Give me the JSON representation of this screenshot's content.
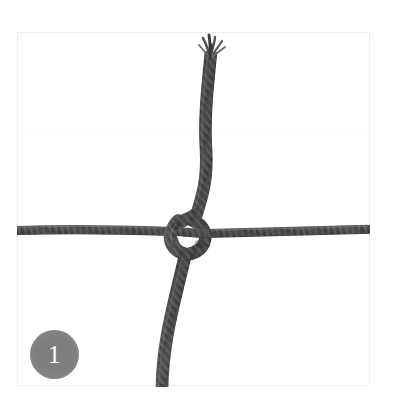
{
  "figure": {
    "title": "Square lashing step 1",
    "width": 394,
    "height": 410,
    "background_color": "#ffffff",
    "frame_border_color": "#e2e2e6"
  },
  "badge": {
    "name": "step-number-badge",
    "number": "1",
    "fill_color": "#7e7e7e",
    "text_color": "#ffffff",
    "diameter_px": 49,
    "position": {
      "x": 30,
      "y": 330
    }
  },
  "illustration": {
    "subject": "two cords crossing at right angles joined by an overhand knot",
    "cord_color": "#4a4a4a",
    "cord_highlight_color": "#6f6f6f",
    "cord_shadow_color": "#2e2e2e",
    "cords": [
      {
        "name": "horizontal-cord",
        "orientation": "horizontal",
        "thickness_px": 9,
        "y_px": 229,
        "x_start_px": 17,
        "x_end_px": 369
      },
      {
        "name": "vertical-cord",
        "orientation": "vertical",
        "thickness_px": 13,
        "x_px": 205,
        "y_start_px": 40,
        "y_end_px": 387,
        "frayed_end": "top"
      }
    ],
    "knot": {
      "name": "overhand-knot",
      "type": "loop around horizontal cord",
      "center": {
        "x": 190,
        "y": 236
      },
      "width_px": 52,
      "height_px": 56
    },
    "frayed_tip": {
      "name": "frayed-cord-end",
      "strand_count": 5,
      "position": {
        "x": 212,
        "y": 46
      }
    }
  }
}
